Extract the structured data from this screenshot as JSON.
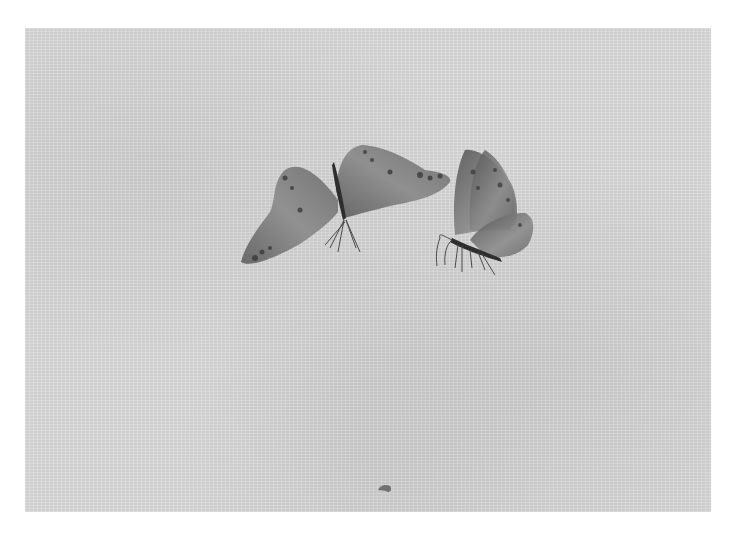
{
  "artwork": {
    "subject": "Two butterflies painted on silk",
    "medium_appearance": "ink on silk, grayscale",
    "colors": {
      "page_background": "#ffffff",
      "silk": "#dcdcdc",
      "ink_dark": "#3a3a3a",
      "ink_mid": "#6e6e6e",
      "ink_light": "#9a9a9a"
    },
    "elements": [
      {
        "name": "butterfly-left",
        "description": "Butterfly with wings spread, viewed from above, spotted wing margins"
      },
      {
        "name": "butterfly-right",
        "description": "Butterfly with wings raised, side view, legs extended"
      },
      {
        "name": "small-insect",
        "description": "Small dark mark near bottom center"
      }
    ]
  }
}
